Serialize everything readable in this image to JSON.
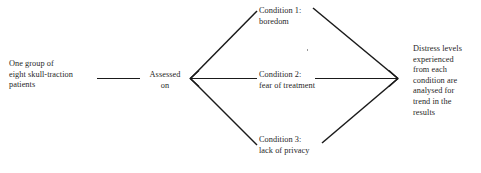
{
  "diagram": {
    "type": "flow-diagram",
    "background_color": "#ffffff",
    "line_color": "#1a1a1a",
    "text_color": "#1f1f1f",
    "nodes": [
      {
        "id": "source",
        "label": "One group of\neight skull-traction\npatients"
      },
      {
        "id": "assessed",
        "label": "Assessed\non"
      },
      {
        "id": "condition_1",
        "label": "Condition 1:\nboredom"
      },
      {
        "id": "condition_2",
        "label": "Condition 2:\nfear of treatment"
      },
      {
        "id": "condition_3",
        "label": "Condition 3:\nlack of privacy"
      },
      {
        "id": "outcome",
        "label": "Distress levels\nexperienced\nfrom each\ncondition are\nanalysed for\ntrend in the\nresults"
      }
    ],
    "connectors": [
      {
        "from": "source",
        "to": "assessed",
        "style": "plain-line"
      },
      {
        "from": "assessed",
        "to": "branch-point",
        "style": "arrow-left"
      },
      {
        "from": "branch-point",
        "to": "condition_1",
        "style": "plain-line"
      },
      {
        "from": "branch-point",
        "to": "condition_2",
        "style": "plain-line"
      },
      {
        "from": "branch-point",
        "to": "condition_3",
        "style": "plain-line"
      },
      {
        "from": "condition_1",
        "to": "outcome",
        "style": "plain-line"
      },
      {
        "from": "condition_2",
        "to": "outcome",
        "style": "arrow-right"
      },
      {
        "from": "condition_3",
        "to": "outcome",
        "style": "plain-line"
      }
    ]
  }
}
